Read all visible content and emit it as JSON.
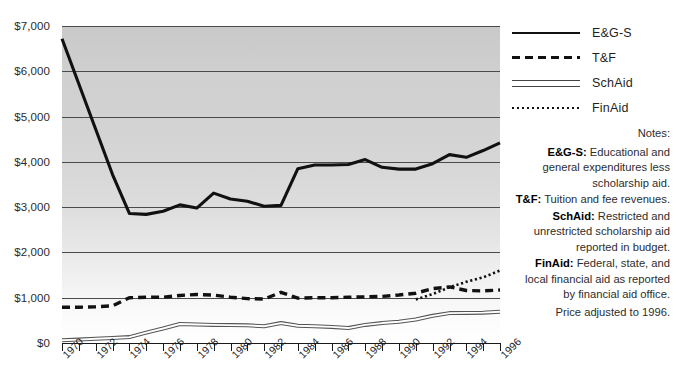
{
  "chart_data": {
    "type": "line",
    "title": "",
    "xlabel": "",
    "ylabel": "",
    "grid": true,
    "legend_position": "right",
    "ylim": [
      0,
      7000
    ],
    "xlim": [
      1970,
      1996
    ],
    "y_ticks": [
      0,
      1000,
      2000,
      3000,
      4000,
      5000,
      6000,
      7000
    ],
    "y_tick_labels": [
      "$0",
      "$1,000",
      "$2,000",
      "$3,000",
      "$4,000",
      "$5,000",
      "$6,000",
      "$7,000"
    ],
    "x_ticks": [
      1970,
      1971,
      1972,
      1973,
      1974,
      1975,
      1976,
      1977,
      1978,
      1979,
      1980,
      1981,
      1982,
      1983,
      1984,
      1985,
      1986,
      1987,
      1988,
      1989,
      1990,
      1991,
      1992,
      1993,
      1994,
      1995,
      1996
    ],
    "x_tick_labels": [
      "1970",
      "1972",
      "1974",
      "1976",
      "1978",
      "1980",
      "1982",
      "1984",
      "1986",
      "1988",
      "1990",
      "1992",
      "1994",
      "1996"
    ],
    "x_labeled_years": [
      1970,
      1972,
      1974,
      1976,
      1978,
      1980,
      1982,
      1984,
      1986,
      1988,
      1990,
      1992,
      1994,
      1996
    ],
    "series": [
      {
        "name": "E&G-S",
        "style": "solid-thick",
        "color": "#111111",
        "x": [
          1970,
          1971,
          1972,
          1973,
          1974,
          1975,
          1976,
          1977,
          1978,
          1979,
          1980,
          1981,
          1982,
          1983,
          1984,
          1985,
          1986,
          1987,
          1988,
          1989,
          1990,
          1991,
          1992,
          1993,
          1994,
          1995,
          1996
        ],
        "values": [
          6720,
          5720,
          4720,
          3720,
          2860,
          2840,
          2910,
          3050,
          2980,
          3310,
          3180,
          3130,
          3020,
          3040,
          3850,
          3930,
          3930,
          3940,
          4050,
          3880,
          3840,
          3840,
          3960,
          4160,
          4100,
          4250,
          4420
        ]
      },
      {
        "name": "T&F",
        "style": "dashed-thick",
        "color": "#111111",
        "x": [
          1970,
          1971,
          1972,
          1973,
          1974,
          1975,
          1976,
          1977,
          1978,
          1979,
          1980,
          1981,
          1982,
          1983,
          1984,
          1985,
          1986,
          1987,
          1988,
          1989,
          1990,
          1991,
          1992,
          1993,
          1994,
          1995,
          1996
        ],
        "values": [
          790,
          790,
          800,
          820,
          1000,
          1010,
          1010,
          1050,
          1070,
          1060,
          1010,
          980,
          970,
          1120,
          990,
          1000,
          1000,
          1010,
          1020,
          1030,
          1060,
          1100,
          1200,
          1240,
          1160,
          1150,
          1170
        ]
      },
      {
        "name": "SchAid",
        "style": "double-thin",
        "color": "#555555",
        "x": [
          1970,
          1971,
          1972,
          1973,
          1974,
          1975,
          1976,
          1977,
          1978,
          1979,
          1980,
          1981,
          1982,
          1983,
          1984,
          1985,
          1986,
          1987,
          1988,
          1989,
          1990,
          1991,
          1992,
          1993,
          1994,
          1995,
          1996
        ],
        "values": [
          60,
          75,
          95,
          110,
          130,
          230,
          320,
          420,
          410,
          400,
          395,
          390,
          370,
          440,
          380,
          370,
          355,
          330,
          400,
          440,
          470,
          520,
          600,
          660,
          665,
          670,
          690
        ]
      },
      {
        "name": "FinAid",
        "style": "dotted",
        "color": "#111111",
        "x": [
          1991,
          1992,
          1993,
          1994,
          1995,
          1996
        ],
        "values": [
          960,
          1080,
          1230,
          1350,
          1450,
          1600
        ]
      }
    ]
  },
  "legend": {
    "items": [
      {
        "label": "E&G-S",
        "style": "solid-thick"
      },
      {
        "label": "T&F",
        "style": "dashed-thick"
      },
      {
        "label": "SchAid",
        "style": "double-thin"
      },
      {
        "label": "FinAid",
        "style": "dotted"
      }
    ]
  },
  "notes": {
    "title": "Notes:",
    "items": [
      {
        "key": "E&G-S:",
        "text": " Educational and general expenditures less scholarship aid."
      },
      {
        "key": "T&F:",
        "text": " Tuition and fee revenues."
      },
      {
        "key": "SchAid:",
        "text": " Restricted and unrestricted scholarship aid reported in budget."
      },
      {
        "key": "FinAid:",
        "text": " Federal, state, and local financial aid as reported by financial aid office."
      }
    ],
    "price_note": "Price adjusted to 1996."
  }
}
